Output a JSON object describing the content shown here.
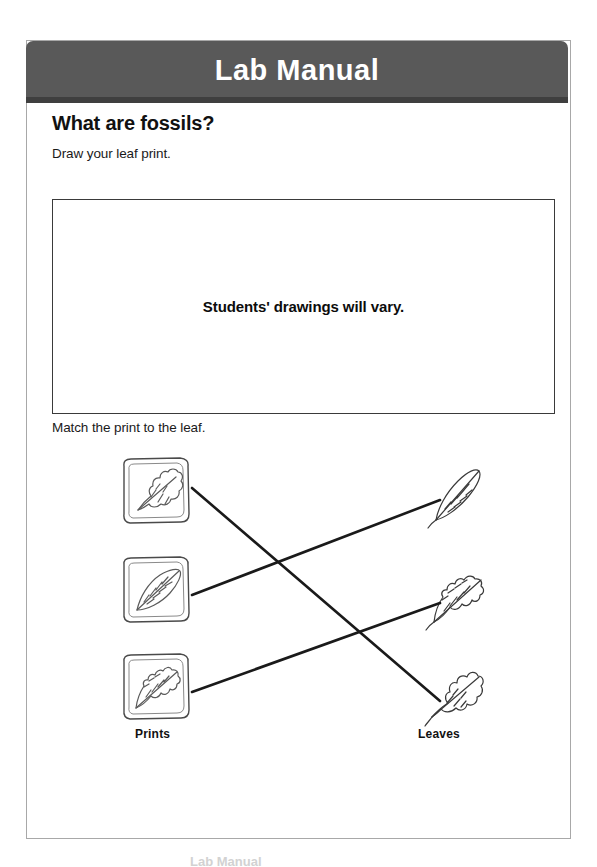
{
  "header": {
    "title": "Lab Manual"
  },
  "page": {
    "section_heading": "What are fossils?",
    "draw_instruction": "Draw your leaf print.",
    "drawing_box_answer": "Students' drawings will vary.",
    "match_instruction": "Match the print to the leaf."
  },
  "matching": {
    "left_column_label": "Prints",
    "right_column_label": "Leaves",
    "prints": [
      {
        "name": "print-lobed-leaf",
        "description": "fossil print of a lobed oak-like leaf",
        "leaf_shape": "lobed"
      },
      {
        "name": "print-oval-leaf",
        "description": "fossil print of a smooth oval leaf",
        "leaf_shape": "oval"
      },
      {
        "name": "print-toothed-leaf",
        "description": "fossil print of a toothed leaf",
        "leaf_shape": "toothed"
      }
    ],
    "leaves": [
      {
        "name": "leaf-narrow-smooth",
        "description": "narrow smooth-edged leaf",
        "leaf_shape": "oval"
      },
      {
        "name": "leaf-wavy-toothed",
        "description": "wavy toothed-edge leaf",
        "leaf_shape": "toothed"
      },
      {
        "name": "leaf-lobed",
        "description": "lobed oak-like leaf",
        "leaf_shape": "lobed"
      }
    ],
    "connections": [
      {
        "from": "print-lobed-leaf",
        "to": "leaf-lobed",
        "from_index": 0,
        "to_index": 2
      },
      {
        "from": "print-oval-leaf",
        "to": "leaf-narrow-smooth",
        "from_index": 1,
        "to_index": 0
      },
      {
        "from": "print-toothed-leaf",
        "to": "leaf-wavy-toothed",
        "from_index": 2,
        "to_index": 1
      }
    ]
  },
  "colors": {
    "header_background": "#595959",
    "header_shadow": "#3f3f3f",
    "header_text": "#ffffff",
    "page_border": "#a8a8a8",
    "box_border": "#3a3a3a",
    "body_text": "#1a1a1a",
    "line_stroke": "#1a1a1a",
    "drawing_stroke": "#555555"
  },
  "footer": {
    "cutoff_text": "Lab Manual"
  }
}
